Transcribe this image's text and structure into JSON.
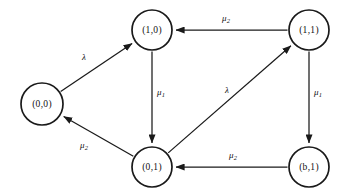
{
  "diagram": {
    "type": "state-transition-diagram",
    "background_color": "#ffffff",
    "stroke_color": "#1a1a1a",
    "nodes": [
      {
        "id": "s00",
        "label": "(0,0)",
        "cx": 42,
        "cy": 104,
        "r": 21
      },
      {
        "id": "s10",
        "label": "(1,0)",
        "cx": 152,
        "cy": 30,
        "r": 20
      },
      {
        "id": "s11",
        "label": "(1,1)",
        "cx": 309,
        "cy": 30,
        "r": 20
      },
      {
        "id": "s01",
        "label": "(0,1)",
        "cx": 152,
        "cy": 167,
        "r": 20
      },
      {
        "id": "sb1",
        "label": "(b,1)",
        "cx": 309,
        "cy": 167,
        "r": 20
      }
    ],
    "edges": [
      {
        "id": "e1",
        "from": "s00",
        "to": "s10",
        "symbol": "λ",
        "sub": "",
        "label_x": 84,
        "label_y": 58
      },
      {
        "id": "e2",
        "from": "s11",
        "to": "s10",
        "symbol": "μ",
        "sub": "2",
        "label_x": 226,
        "label_y": 19
      },
      {
        "id": "e3",
        "from": "s10",
        "to": "s01",
        "symbol": "μ",
        "sub": "1",
        "label_x": 161,
        "label_y": 93
      },
      {
        "id": "e4",
        "from": "s01",
        "to": "s11",
        "symbol": "λ",
        "sub": "",
        "label_x": 227,
        "label_y": 91
      },
      {
        "id": "e5",
        "from": "s11",
        "to": "sb1",
        "symbol": "μ",
        "sub": "1",
        "label_x": 318,
        "label_y": 93
      },
      {
        "id": "e6",
        "from": "sb1",
        "to": "s01",
        "symbol": "μ",
        "sub": "2",
        "label_x": 233,
        "label_y": 156
      },
      {
        "id": "e7",
        "from": "s01",
        "to": "s00",
        "symbol": "μ",
        "sub": "2",
        "label_x": 84,
        "label_y": 146
      }
    ]
  }
}
